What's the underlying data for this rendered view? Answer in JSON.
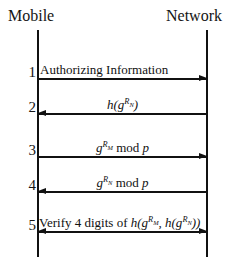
{
  "diagram": {
    "type": "sequence-diagram",
    "background_color": "#ffffff",
    "line_color": "#111111",
    "actors": [
      {
        "id": "mobile",
        "label": "Mobile"
      },
      {
        "id": "network",
        "label": "Network"
      }
    ],
    "messages": [
      {
        "index": "1",
        "direction": "right",
        "from": "mobile",
        "to": "network",
        "label_plain": "Authorizing Information",
        "label_parts": [
          {
            "text": "Authorizing Information",
            "style": "upright"
          }
        ]
      },
      {
        "index": "2",
        "direction": "left",
        "from": "network",
        "to": "mobile",
        "label_plain": "h(g^{R_N})",
        "label_parts": [
          {
            "text": "h(g",
            "style": "italic"
          },
          {
            "text": "R",
            "style": "superscript"
          },
          {
            "text": "N",
            "style": "superscript-subscript"
          },
          {
            "text": ")",
            "style": "italic"
          }
        ]
      },
      {
        "index": "3",
        "direction": "right",
        "from": "mobile",
        "to": "network",
        "label_plain": "g^{R_M} mod p",
        "label_parts": [
          {
            "text": "g",
            "style": "italic"
          },
          {
            "text": "R",
            "style": "superscript"
          },
          {
            "text": "M",
            "style": "superscript-subscript"
          },
          {
            "text": " mod ",
            "style": "upright"
          },
          {
            "text": "p",
            "style": "italic"
          }
        ]
      },
      {
        "index": "4",
        "direction": "left",
        "from": "network",
        "to": "mobile",
        "label_plain": "g^{R_N} mod p",
        "label_parts": [
          {
            "text": "g",
            "style": "italic"
          },
          {
            "text": "R",
            "style": "superscript"
          },
          {
            "text": "N",
            "style": "superscript-subscript"
          },
          {
            "text": " mod ",
            "style": "upright"
          },
          {
            "text": "p",
            "style": "italic"
          }
        ]
      },
      {
        "index": "5",
        "direction": "both",
        "from": "mobile",
        "to": "network",
        "label_plain": "Verify 4 digits of h(g^{R_M}, h(g^{R_N}))",
        "label_parts": [
          {
            "text": "Verify 4 digits of ",
            "style": "upright"
          },
          {
            "text": "h(g",
            "style": "italic"
          },
          {
            "text": "R",
            "style": "superscript"
          },
          {
            "text": "M",
            "style": "superscript-subscript"
          },
          {
            "text": ", h(g",
            "style": "italic"
          },
          {
            "text": "R",
            "style": "superscript"
          },
          {
            "text": "N",
            "style": "superscript-subscript"
          },
          {
            "text": "))",
            "style": "italic"
          }
        ]
      }
    ]
  }
}
